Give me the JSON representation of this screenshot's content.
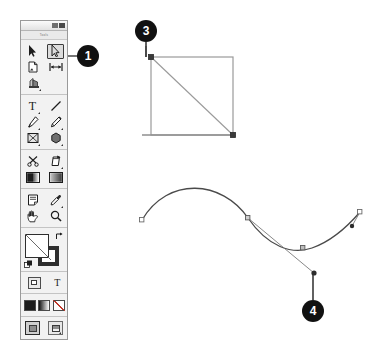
{
  "app": {
    "panel_title": "Tools",
    "window_buttons": [
      "minimize-button",
      "close-button"
    ]
  },
  "toolbar": {
    "groups": [
      {
        "name": "selection-group",
        "rows": [
          {
            "tools": [
              {
                "id": "selection-tool",
                "icon": "selection-arrow-icon",
                "selected": false,
                "has_flyout": false
              },
              {
                "id": "direct-selection-tool",
                "icon": "direct-selection-arrow-icon",
                "selected": true,
                "has_flyout": false
              }
            ]
          },
          {
            "tools": [
              {
                "id": "page-tool",
                "icon": "page-icon",
                "selected": false,
                "has_flyout": false
              },
              {
                "id": "gap-tool",
                "icon": "gap-arrows-icon",
                "selected": false,
                "has_flyout": false
              }
            ]
          },
          {
            "tools": [
              {
                "id": "content-collector-tool",
                "icon": "content-collector-icon",
                "selected": false,
                "has_flyout": true
              }
            ]
          }
        ]
      },
      {
        "name": "drawing-group",
        "rows": [
          {
            "tools": [
              {
                "id": "type-tool",
                "icon": "type-T-icon",
                "selected": false,
                "has_flyout": true
              },
              {
                "id": "line-tool",
                "icon": "line-diagonal-icon",
                "selected": false,
                "has_flyout": false
              }
            ]
          },
          {
            "tools": [
              {
                "id": "pen-tool",
                "icon": "pen-nib-icon",
                "selected": false,
                "has_flyout": true
              },
              {
                "id": "pencil-tool",
                "icon": "pencil-icon",
                "selected": false,
                "has_flyout": true
              }
            ]
          },
          {
            "tools": [
              {
                "id": "frame-tool",
                "icon": "rectangle-frame-icon",
                "selected": false,
                "has_flyout": true
              },
              {
                "id": "shape-tool",
                "icon": "polygon-shape-icon",
                "selected": false,
                "has_flyout": true
              }
            ]
          }
        ]
      },
      {
        "name": "transform-group",
        "rows": [
          {
            "tools": [
              {
                "id": "scissors-tool",
                "icon": "scissors-icon",
                "selected": false,
                "has_flyout": false
              },
              {
                "id": "free-transform-tool",
                "icon": "free-transform-icon",
                "selected": false,
                "has_flyout": true
              }
            ]
          },
          {
            "tools": [
              {
                "id": "gradient-swatch-tool",
                "icon": "gradient-swatch-icon",
                "selected": false,
                "has_flyout": false
              },
              {
                "id": "gradient-feather-tool",
                "icon": "gradient-feather-icon",
                "selected": false,
                "has_flyout": false
              }
            ]
          }
        ]
      },
      {
        "name": "utility-group",
        "rows": [
          {
            "tools": [
              {
                "id": "note-tool",
                "icon": "note-icon",
                "selected": false,
                "has_flyout": false
              },
              {
                "id": "eyedropper-tool",
                "icon": "eyedropper-icon",
                "selected": false,
                "has_flyout": true
              }
            ]
          },
          {
            "tools": [
              {
                "id": "hand-tool",
                "icon": "hand-icon",
                "selected": false,
                "has_flyout": false
              },
              {
                "id": "zoom-tool",
                "icon": "magnifier-icon",
                "selected": false,
                "has_flyout": false
              }
            ]
          }
        ]
      }
    ],
    "color_controls": {
      "fill_swatch": {
        "name": "fill-swatch",
        "color": "#ffffff"
      },
      "stroke_swatch": {
        "name": "stroke-swatch",
        "color": "#2e2e2e"
      },
      "swap_icon": "swap-fill-stroke-icon",
      "default_icon": "default-fill-stroke-icon"
    },
    "format_row": {
      "container_button": {
        "name": "formatting-affects-container-button",
        "icon": "container-icon"
      },
      "text_button": {
        "name": "formatting-affects-text-button",
        "label": "T"
      }
    },
    "apply_row": [
      {
        "name": "apply-color-button",
        "icon": "solid-color-icon",
        "kind": "black"
      },
      {
        "name": "apply-gradient-button",
        "icon": "gradient-icon",
        "kind": "grad"
      },
      {
        "name": "apply-none-button",
        "icon": "none-icon",
        "kind": "none"
      }
    ],
    "view_mode_row": [
      {
        "name": "normal-view-mode-button",
        "icon": "normal-mode-icon",
        "active": true
      },
      {
        "name": "preview-view-mode-button",
        "icon": "preview-mode-icon",
        "active": false,
        "has_flyout": true
      }
    ]
  },
  "callouts": [
    {
      "id": "callout-1",
      "label": "1",
      "x": 88,
      "y": 56,
      "target": "direct-selection-tool"
    },
    {
      "id": "callout-3",
      "label": "3",
      "x": 146,
      "y": 31,
      "target": "corner-anchor-point"
    },
    {
      "id": "callout-4",
      "label": "4",
      "x": 313,
      "y": 311,
      "target": "direction-handle-endpoint"
    }
  ],
  "artwork": {
    "shape_path": {
      "name": "triangle-rectangle-path",
      "description": "Rectangle outline with diagonal from top-left to bottom-right and an extended baseline",
      "stroke": "#8a8a8a",
      "rect": {
        "x": 151,
        "y": 57,
        "w": 82,
        "h": 78
      },
      "anchors": [
        {
          "name": "anchor-top-left",
          "x": 151,
          "y": 57,
          "filled": true
        },
        {
          "name": "anchor-bottom-right",
          "x": 233,
          "y": 135,
          "filled": true
        }
      ],
      "baseline": {
        "x1": 142,
        "y1": 135,
        "x2": 233,
        "y2": 135
      }
    },
    "curve_path": {
      "name": "s-curve-path",
      "description": "Bezier S-curve with anchor points and one selected direction handle",
      "stroke": "#4a4a4a",
      "anchors": [
        {
          "name": "anchor-curve-start",
          "x": 142,
          "y": 220,
          "filled": false
        },
        {
          "name": "anchor-curve-mid",
          "x": 248,
          "y": 218,
          "filled": false
        },
        {
          "name": "anchor-curve-low",
          "x": 303,
          "y": 248,
          "filled": false
        },
        {
          "name": "anchor-curve-end",
          "x": 360,
          "y": 212,
          "filled": false
        }
      ],
      "handles": [
        {
          "name": "direction-handle-main",
          "from_x": 248,
          "from_y": 218,
          "to_x": 314,
          "to_y": 273
        },
        {
          "name": "direction-handle-right",
          "from_x": 360,
          "from_y": 212,
          "to_x": 352,
          "to_y": 226
        }
      ]
    }
  }
}
